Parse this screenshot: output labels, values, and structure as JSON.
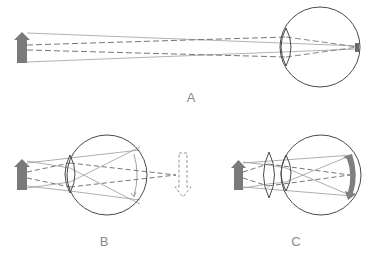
{
  "diagram": {
    "colors": {
      "outline": "#4a4a4a",
      "ray": "#8c8c8c",
      "arrow_fill": "#7a7a7a",
      "retina_image": "#7f7f7f",
      "label": "#8a8a8a"
    },
    "panels": [
      {
        "id": "A",
        "label": "A",
        "description": "Distant object focused on retina (normal eye)"
      },
      {
        "id": "B",
        "label": "B",
        "description": "Near object focuses behind retina (hyperopia); virtual image shown dashed"
      },
      {
        "id": "C",
        "label": "C",
        "description": "Converging corrective lens brings focus onto retina"
      }
    ]
  }
}
